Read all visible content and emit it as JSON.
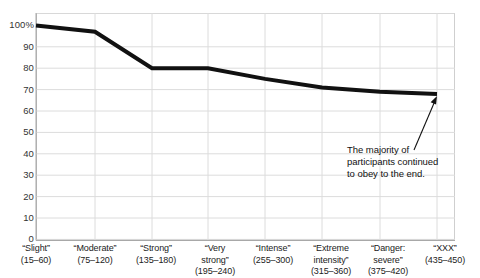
{
  "chart_data": {
    "type": "line",
    "title": "",
    "xlabel": "",
    "ylabel": "",
    "ylim": [
      0,
      100
    ],
    "ytick_values": [
      0,
      10,
      20,
      30,
      40,
      50,
      60,
      70,
      80,
      90,
      100
    ],
    "ytick_labels": [
      "0",
      "10",
      "20",
      "30",
      "40",
      "50",
      "60",
      "70",
      "80",
      "90",
      "100%"
    ],
    "grid": true,
    "legend": "none",
    "line_color": "#111111",
    "line_width_px": 4,
    "categories": [
      "“Slight” (15–60)",
      "“Moderate” (75–120)",
      "“Strong” (135–180)",
      "“Very strong” (195–240)",
      "“Intense” (255–300)",
      "“Extreme intensity” (315–360)",
      "“Danger: severe” (375–420)",
      "“XXX” (435–450)"
    ],
    "xtick_labels": [
      {
        "line1": "“Slight”",
        "line2": "(15–60)",
        "line3": ""
      },
      {
        "line1": "“Moderate”",
        "line2": "(75–120)",
        "line3": ""
      },
      {
        "line1": "“Strong”",
        "line2": "(135–180)",
        "line3": ""
      },
      {
        "line1": "“Very",
        "line2": "strong”",
        "line3": "(195–240)"
      },
      {
        "line1": "“Intense”",
        "line2": "(255–300)",
        "line3": ""
      },
      {
        "line1": "“Extreme",
        "line2": "intensity”",
        "line3": "(315–360)"
      },
      {
        "line1": "“Danger:",
        "line2": "severe”",
        "line3": "(375–420)"
      },
      {
        "line1": "“XXX”",
        "line2": "(435–450)",
        "line3": ""
      }
    ],
    "values": [
      100,
      97,
      80,
      80,
      75,
      71,
      69,
      68
    ],
    "annotations": [
      {
        "text": "The majority of participants continued to obey to the end.",
        "lines": [
          "The majority of",
          "participants continued",
          "to obey to the end."
        ],
        "arrow": {
          "from_x": 415,
          "from_y": 150,
          "to_x": 437,
          "to_y": 97
        }
      }
    ]
  }
}
